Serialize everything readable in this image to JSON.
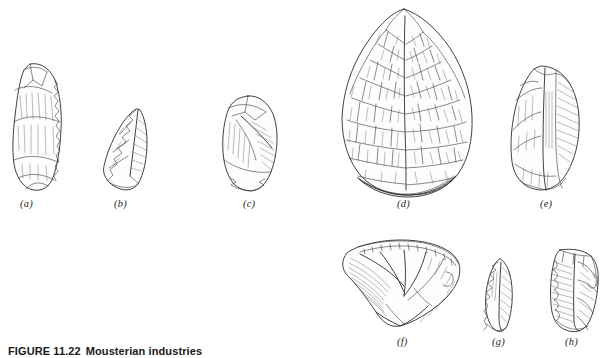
{
  "figure": {
    "number": "FIGURE 11.22",
    "caption": "Mousterian industries",
    "background_color": "#ffffff",
    "ink_color": "#2b2b2b",
    "plate_width": 615,
    "plate_height": 358,
    "medium": "pen-and-ink archaeological line drawing"
  },
  "artifacts": [
    {
      "id": "a",
      "label": "(a)",
      "name": "elongated-side-scraper",
      "description": "Elongated flake tool with steeply retouched convex right edge and plain ventral face",
      "label_x": 27,
      "label_y": 200,
      "bbox": {
        "x": 8,
        "y": 62,
        "w": 58,
        "h": 130
      }
    },
    {
      "id": "b",
      "label": "(b)",
      "name": "mousterian-point",
      "description": "Triangular pointed flake, retouched left margin, broad base",
      "label_x": 120,
      "label_y": 200,
      "bbox": {
        "x": 100,
        "y": 108,
        "w": 52,
        "h": 82
      }
    },
    {
      "id": "c",
      "label": "(c)",
      "name": "ovate-flake-scraper",
      "description": "Rounded ovate flake with dorsal ridge scars and retouched distal edge",
      "label_x": 249,
      "label_y": 200,
      "bbox": {
        "x": 220,
        "y": 95,
        "w": 58,
        "h": 96
      }
    },
    {
      "id": "d",
      "label": "(d)",
      "name": "bifacial-handaxe",
      "description": "Large teardrop / cordiform bifacial handaxe with dense flake scars and stippled cortex butt",
      "label_x": 403,
      "label_y": 200,
      "bbox": {
        "x": 333,
        "y": 8,
        "w": 140,
        "h": 186
      }
    },
    {
      "id": "e",
      "label": "(e)",
      "name": "elongated-blade-point",
      "description": "Elongated blade-like point with central dorsal ridge and retouched margins",
      "label_x": 546,
      "label_y": 200,
      "bbox": {
        "x": 508,
        "y": 64,
        "w": 76,
        "h": 126
      }
    },
    {
      "id": "f",
      "label": "(f)",
      "name": "levallois-disc-core",
      "description": "Broad fan-shaped Levallois / discoidal core seen in profile with prepared striking platform",
      "label_x": 402,
      "label_y": 345,
      "bbox": {
        "x": 340,
        "y": 238,
        "w": 122,
        "h": 90
      }
    },
    {
      "id": "g",
      "label": "(g)",
      "name": "narrow-retouched-blade",
      "description": "Small narrow blade with denticulate retouch along the left edge",
      "label_x": 497,
      "label_y": 345,
      "bbox": {
        "x": 480,
        "y": 258,
        "w": 36,
        "h": 74
      }
    },
    {
      "id": "h",
      "label": "(h)",
      "name": "rectangular-flake-tool",
      "description": "Squat rectangular flake tool with notched right margin and hatched dorsal surface",
      "label_x": 570,
      "label_y": 345,
      "bbox": {
        "x": 548,
        "y": 248,
        "w": 52,
        "h": 84
      }
    }
  ]
}
